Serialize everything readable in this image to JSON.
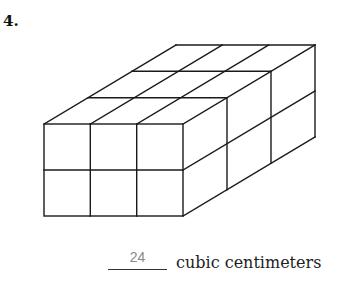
{
  "problem": {
    "number": "4.",
    "answer": "24",
    "unit_label": "cubic centimeters"
  },
  "figure": {
    "type": "rectangular-prism-of-unit-cubes",
    "columns_front": 3,
    "rows_high": 2,
    "cubes_deep": 4,
    "line_color": "#1a1a1a"
  }
}
